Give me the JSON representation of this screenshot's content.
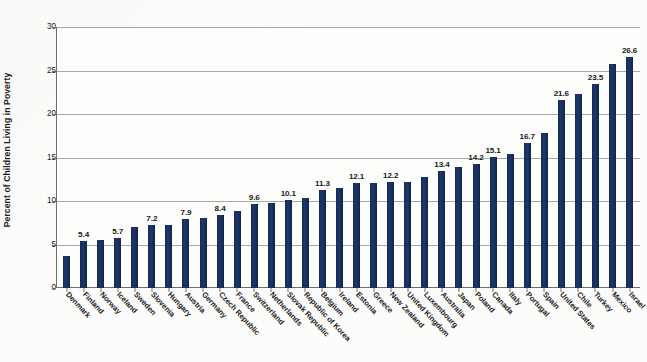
{
  "chart_data": {
    "type": "bar",
    "title": "",
    "xlabel": "",
    "ylabel": "Percent of Children Living in Poverty",
    "ylim": [
      0,
      30
    ],
    "ytick_labels": [
      "0",
      "5",
      "10",
      "15",
      "20",
      "25",
      "30"
    ],
    "yticks": [
      0,
      5,
      10,
      15,
      20,
      25,
      30
    ],
    "grid": true,
    "legend": "none",
    "bar_color": "#1b3263",
    "label_rule": "every other bar labeled, starting with the 2nd bar",
    "categories": [
      "Denmark",
      "Finland",
      "Norway",
      "Iceland",
      "Sweden",
      "Slovenia",
      "Hungary",
      "Austria",
      "Germany",
      "Czech Republic",
      "France",
      "Switzerland",
      "Netherlands",
      "Slovak Republic",
      "Republic of Korea",
      "Belgium",
      "Ireland",
      "Estonia",
      "Greece",
      "New Zealand",
      "United Kingdom",
      "Luxembourg",
      "Australia",
      "Japan",
      "Poland",
      "Canada",
      "Italy",
      "Portugal",
      "Spain",
      "United States",
      "Chile",
      "Turkey",
      "Mexico",
      "Israel"
    ],
    "values": [
      3.7,
      5.4,
      5.5,
      5.7,
      7.0,
      7.2,
      7.3,
      7.9,
      8.1,
      8.4,
      8.8,
      9.6,
      9.8,
      10.1,
      10.3,
      11.3,
      11.5,
      12.1,
      12.1,
      12.2,
      12.2,
      12.8,
      13.4,
      13.9,
      14.2,
      15.1,
      15.4,
      16.7,
      17.8,
      21.6,
      22.3,
      23.5,
      25.7,
      26.6
    ],
    "labels": [
      "",
      "5.4",
      "",
      "5.7",
      "",
      "7.2",
      "",
      "7.9",
      "",
      "8.4",
      "",
      "9.6",
      "",
      "10.1",
      "",
      "11.3",
      "",
      "12.1",
      "",
      "12.2",
      "",
      "",
      "13.4",
      "",
      "14.2",
      "15.1",
      "",
      "16.7",
      "",
      "21.6",
      "",
      "23.5",
      "",
      "26.6"
    ]
  }
}
